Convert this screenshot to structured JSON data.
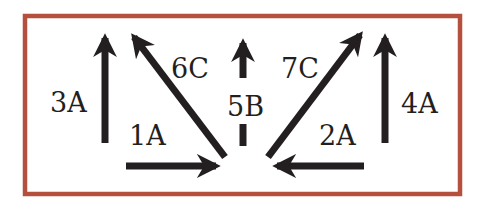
{
  "diagram": {
    "frame_color": "#b5503f",
    "arrow_color": "#231f20",
    "arrows": [
      {
        "id": "3A",
        "label": "3A",
        "direction": "up"
      },
      {
        "id": "6C",
        "label": "6C",
        "direction": "up-left"
      },
      {
        "id": "5B",
        "label": "5B",
        "direction": "up"
      },
      {
        "id": "7C",
        "label": "7C",
        "direction": "up-right"
      },
      {
        "id": "4A",
        "label": "4A",
        "direction": "up"
      },
      {
        "id": "1A",
        "label": "1A",
        "direction": "right"
      },
      {
        "id": "2A",
        "label": "2A",
        "direction": "left"
      }
    ]
  }
}
